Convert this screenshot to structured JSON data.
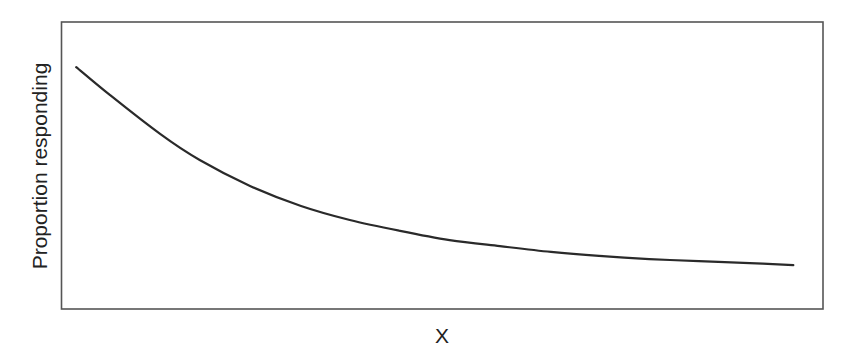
{
  "chart_data": {
    "type": "line",
    "title": "",
    "xlabel": "X",
    "ylabel": "Proportion responding",
    "xlim": [
      0,
      100
    ],
    "ylim": [
      0,
      1
    ],
    "grid": false,
    "legend": null,
    "axis_ticks": "none",
    "series": [
      {
        "name": "response curve",
        "color": "#2a2a2a",
        "x": [
          2,
          6.4,
          13,
          18.2,
          24.8,
          31.5,
          37.9,
          44.5,
          51,
          57.6,
          64.3,
          70.6,
          77.2,
          83.7,
          90.4,
          96.1
        ],
        "y": [
          0.843,
          0.746,
          0.61,
          0.519,
          0.429,
          0.359,
          0.31,
          0.272,
          0.24,
          0.219,
          0.199,
          0.185,
          0.174,
          0.167,
          0.16,
          0.153
        ]
      }
    ]
  },
  "frame": {
    "color": "#555555"
  }
}
